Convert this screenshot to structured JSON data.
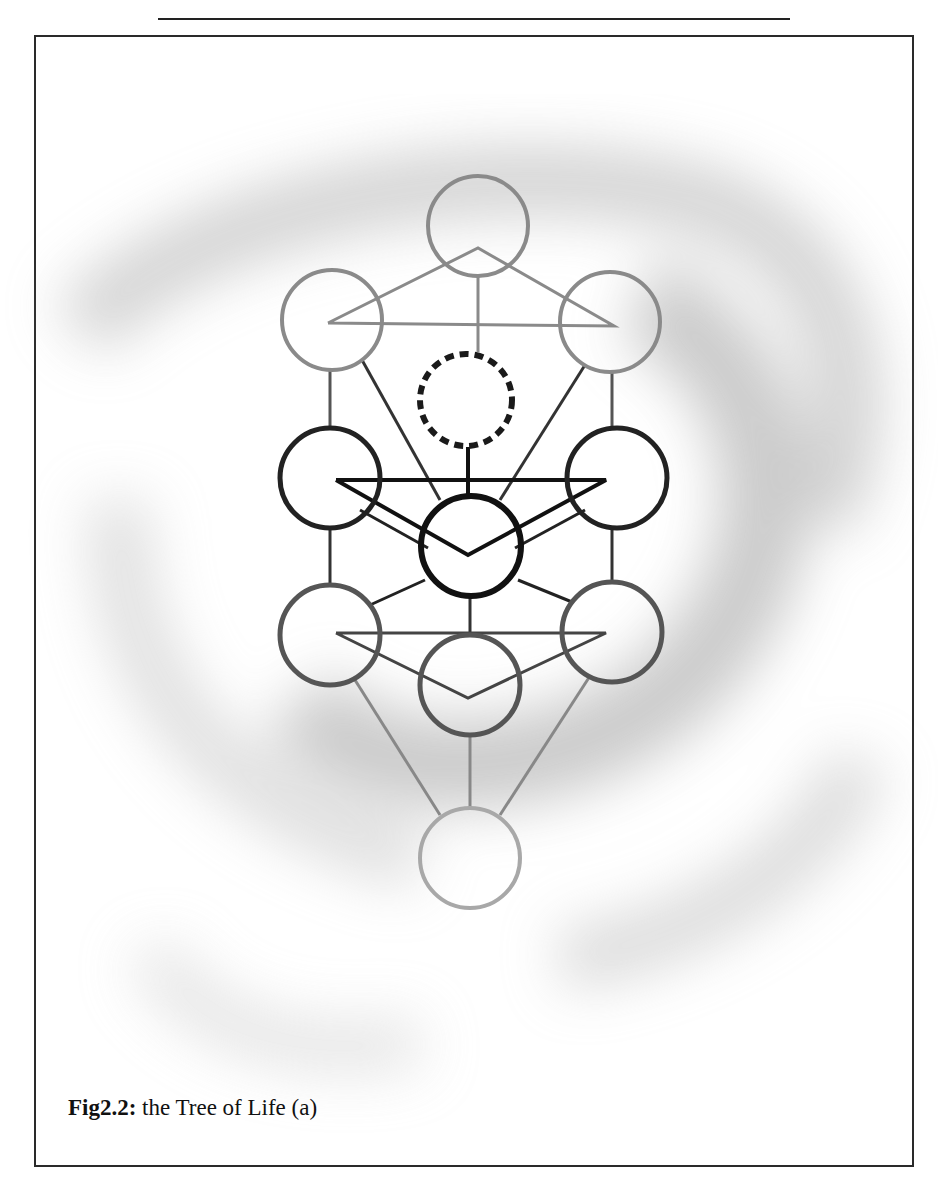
{
  "figure": {
    "label": "Fig2.2:",
    "caption": " the Tree of Life (a)",
    "nodes": [
      {
        "id": "keter",
        "x": 478,
        "y": 226,
        "tone": "light"
      },
      {
        "id": "binah",
        "x": 332,
        "y": 320,
        "tone": "light"
      },
      {
        "id": "chokmah",
        "x": 610,
        "y": 322,
        "tone": "light"
      },
      {
        "id": "daat",
        "x": 466,
        "y": 400,
        "tone": "dashed"
      },
      {
        "id": "chesed",
        "x": 330,
        "y": 478,
        "tone": "dark"
      },
      {
        "id": "geburah",
        "x": 617,
        "y": 478,
        "tone": "dark"
      },
      {
        "id": "tiferet",
        "x": 471,
        "y": 546,
        "tone": "darkest"
      },
      {
        "id": "netzach",
        "x": 330,
        "y": 635,
        "tone": "mid"
      },
      {
        "id": "hod",
        "x": 612,
        "y": 632,
        "tone": "mid"
      },
      {
        "id": "yesod",
        "x": 470,
        "y": 685,
        "tone": "mid"
      },
      {
        "id": "malkuth",
        "x": 470,
        "y": 858,
        "tone": "pale"
      }
    ],
    "colors": {
      "light": "#8a8a8a",
      "dashed": "#1a1a1a",
      "dark": "#222222",
      "darkest": "#111111",
      "mid": "#555555",
      "pale": "#a8a8a8"
    }
  }
}
